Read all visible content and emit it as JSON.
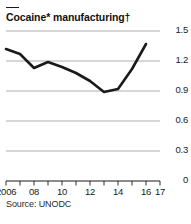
{
  "chart_data": {
    "type": "line",
    "title": "Cocaine* manufacturing†",
    "xlabel": "",
    "ylabel": "",
    "source": "Source: UNODC",
    "grid": true,
    "legend": null,
    "x": [
      2006,
      2007,
      2008,
      2009,
      2010,
      2011,
      2012,
      2013,
      2014,
      2015,
      2016
    ],
    "values": [
      1.32,
      1.27,
      1.13,
      1.19,
      1.14,
      1.08,
      1.0,
      0.89,
      0.92,
      1.12,
      1.37
    ],
    "xlim": [
      2006,
      2017
    ],
    "ylim": [
      0,
      1.5
    ],
    "yticks": [
      0,
      0.3,
      0.6,
      0.9,
      1.2,
      1.5
    ],
    "ytick_labels": [
      "0",
      "0.3",
      "0.6",
      "0.9",
      "1.2",
      "1.5"
    ],
    "xticks": [
      2006,
      2007,
      2008,
      2009,
      2010,
      2011,
      2012,
      2013,
      2014,
      2015,
      2016,
      2017
    ],
    "xtick_labels": [
      {
        "value": 2006,
        "label": "2006"
      },
      {
        "value": 2008,
        "label": "08"
      },
      {
        "value": 2010,
        "label": "10"
      },
      {
        "value": 2012,
        "label": "12"
      },
      {
        "value": 2014,
        "label": "14"
      },
      {
        "value": 2016,
        "label": "16"
      },
      {
        "value": 2017,
        "label": "17"
      }
    ],
    "line_color": "#1a1a1a",
    "grid_color": "#9a9a9a",
    "axis_color": "#1a1a1a"
  }
}
